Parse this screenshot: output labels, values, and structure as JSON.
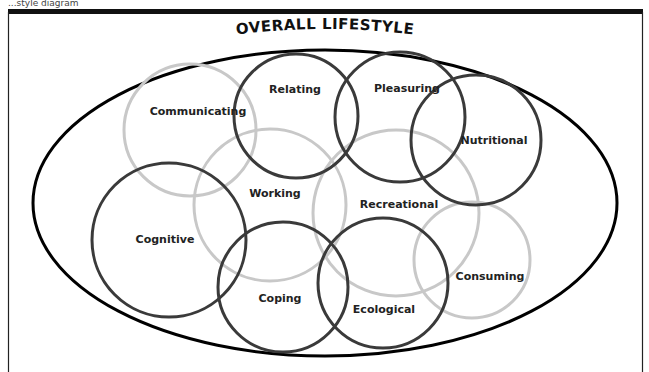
{
  "caption": "...style diagram",
  "title": "OVERALL LIFESTYLE",
  "colors": {
    "frame": "#111111",
    "outer_ellipse": "#000000",
    "dark_circle": "#3a3a3a",
    "light_circle": "#c8c8c8",
    "text": "#222222",
    "background": "#ffffff"
  },
  "outer_ellipse": {
    "cx": 325,
    "cy": 203,
    "rx": 292,
    "ry": 153
  },
  "domains": [
    {
      "id": "communicating",
      "label": "Communicating",
      "tone": "light",
      "cx": 190,
      "cy": 130,
      "r": 66,
      "lx": 198,
      "ly": 112
    },
    {
      "id": "relating",
      "label": "Relating",
      "tone": "dark",
      "cx": 296,
      "cy": 116,
      "r": 62,
      "lx": 295,
      "ly": 90
    },
    {
      "id": "pleasuring",
      "label": "Pleasuring",
      "tone": "dark",
      "cx": 400,
      "cy": 117,
      "r": 65,
      "lx": 407,
      "ly": 89
    },
    {
      "id": "nutritional",
      "label": "Nutritional",
      "tone": "dark",
      "cx": 476,
      "cy": 140,
      "r": 65,
      "lx": 494,
      "ly": 141
    },
    {
      "id": "working",
      "label": "Working",
      "tone": "light",
      "cx": 270,
      "cy": 205,
      "r": 76,
      "lx": 275,
      "ly": 194
    },
    {
      "id": "recreational",
      "label": "Recreational",
      "tone": "light",
      "cx": 396,
      "cy": 213,
      "r": 83,
      "lx": 399,
      "ly": 205
    },
    {
      "id": "cognitive",
      "label": "Cognitive",
      "tone": "dark",
      "cx": 169,
      "cy": 240,
      "r": 77,
      "lx": 165,
      "ly": 240
    },
    {
      "id": "coping",
      "label": "Coping",
      "tone": "dark",
      "cx": 283,
      "cy": 287,
      "r": 65,
      "lx": 280,
      "ly": 299
    },
    {
      "id": "ecological",
      "label": "Ecological",
      "tone": "dark",
      "cx": 383,
      "cy": 283,
      "r": 65,
      "lx": 384,
      "ly": 310
    },
    {
      "id": "consuming",
      "label": "Consuming",
      "tone": "light",
      "cx": 472,
      "cy": 260,
      "r": 58,
      "lx": 490,
      "ly": 277
    }
  ]
}
